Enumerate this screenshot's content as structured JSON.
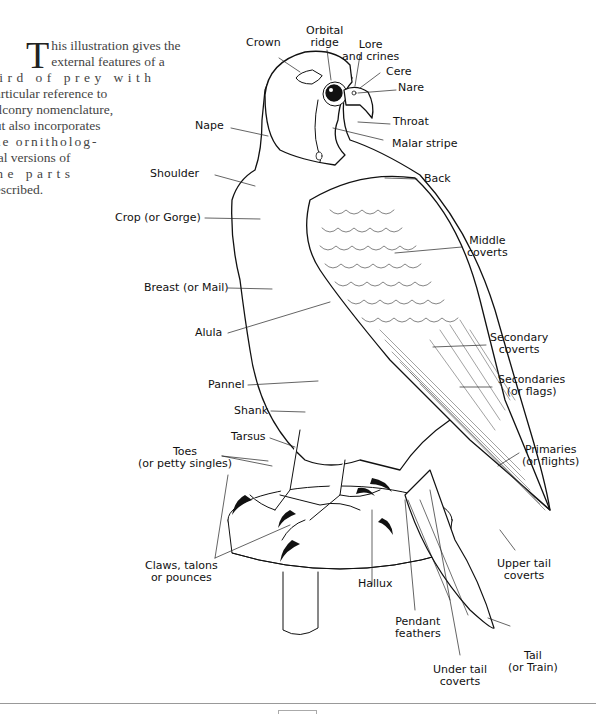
{
  "intro": {
    "dropcap": "T",
    "lines": [
      "his illustration gives the",
      "external features of a",
      "bird of prey with",
      "particular reference to",
      "falconry nomenclature,",
      "but also incorporates",
      "the ornitholog-",
      "ical versions of",
      "the parts",
      "described."
    ]
  },
  "labels": {
    "crown": "Crown",
    "orbital_ridge": [
      "Orbital",
      "ridge"
    ],
    "lore": [
      "Lore",
      "and crines"
    ],
    "cere": "Cere",
    "nare": "Nare",
    "throat": "Throat",
    "malar_stripe": "Malar stripe",
    "nape": "Nape",
    "shoulder": "Shoulder",
    "back": "Back",
    "crop": "Crop (or Gorge)",
    "middle_coverts": [
      "Middle",
      "coverts"
    ],
    "breast": "Breast (or Mail)",
    "alula": "Alula",
    "secondary_coverts": [
      "Secondary",
      "coverts"
    ],
    "pannel": "Pannel",
    "secondaries": [
      "Secondaries",
      "(or flags)"
    ],
    "shank": "Shank",
    "tarsus": "Tarsus",
    "toes": [
      "Toes",
      "(or petty singles)"
    ],
    "primaries": [
      "Primaries",
      "(or flights)"
    ],
    "claws": [
      "Claws, talons",
      "or pounces"
    ],
    "hallux": "Hallux",
    "upper_tail_coverts": [
      "Upper tail",
      "coverts"
    ],
    "pendant_feathers": [
      "Pendant",
      "feathers"
    ],
    "tail": [
      "Tail",
      "(or Train)"
    ],
    "under_tail_coverts": [
      "Under tail",
      "coverts"
    ]
  },
  "page_number": ""
}
